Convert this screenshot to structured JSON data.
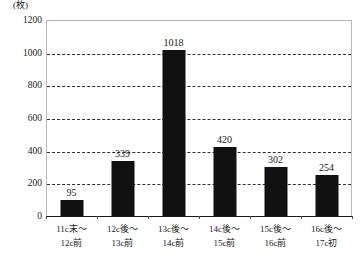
{
  "chart_data": {
    "type": "bar",
    "title": "",
    "subtitle": "",
    "xlabel": "",
    "ylabel": "",
    "unit_label": "(枚)",
    "categories": [
      "11c末～\n12c前",
      "12c後～\n13c前",
      "13c後～\n14c前",
      "14c後～\n15c前",
      "15c後～\n16c前",
      "16c後～\n17c初"
    ],
    "category_lines": [
      [
        "11c末～",
        "12c前"
      ],
      [
        "12c後～",
        "13c前"
      ],
      [
        "13c後～",
        "14c前"
      ],
      [
        "14c後～",
        "15c前"
      ],
      [
        "15c後～",
        "16c前"
      ],
      [
        "16c後～",
        "17c初"
      ]
    ],
    "values": [
      95,
      339,
      1018,
      420,
      302,
      254
    ],
    "value_labels": [
      "95",
      "339",
      "1018",
      "420",
      "302",
      "254"
    ],
    "ylim": [
      0,
      1200
    ],
    "yticks": [
      0,
      200,
      400,
      600,
      800,
      1000,
      1200
    ],
    "ytick_labels": [
      "0",
      "200",
      "400",
      "600",
      "800",
      "1000",
      "1200"
    ],
    "grid": true,
    "grid_style": "dashed",
    "legend": false,
    "legend_position": "none",
    "bar_color": "#111111",
    "grid_color": "#2f2f2f",
    "frame_color": "#b9b9b9",
    "axis_color": "#1a1a1a",
    "background_color": "#ffffff"
  }
}
